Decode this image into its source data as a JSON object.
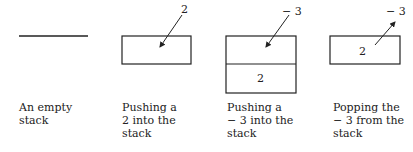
{
  "figure": {
    "panels": [
      {
        "id": "empty",
        "caption": [
          "An empty",
          "stack"
        ]
      },
      {
        "id": "push2",
        "caption": [
          "Pushing a",
          "2 into the",
          "stack"
        ],
        "arrow_label": "2"
      },
      {
        "id": "push-3",
        "caption": [
          "Pushing a",
          "− 3 into the",
          "stack"
        ],
        "arrow_label": "− 3",
        "stack_items": [
          "",
          "2"
        ]
      },
      {
        "id": "pop-3",
        "caption": [
          "Popping the",
          "− 3 from the",
          "stack"
        ],
        "arrow_label": "− 3",
        "stack_items": [
          "2"
        ]
      }
    ]
  }
}
